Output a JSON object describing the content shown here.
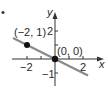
{
  "figure": {
    "bullet": "•",
    "axes": {
      "x_label": "x",
      "y_label": "y",
      "x_ticks": [
        {
          "value": -2,
          "label": "−2"
        },
        {
          "value": 2,
          "label": "2"
        }
      ],
      "y_ticks": [
        {
          "value": 2,
          "label": "2"
        },
        {
          "value": -1,
          "label": "−1"
        }
      ]
    },
    "points": [
      {
        "x": -2,
        "y": 1,
        "label": "(−2, 1)"
      },
      {
        "x": 0,
        "y": 0,
        "label": "(0, 0)"
      }
    ],
    "line": {
      "slope": -0.5,
      "intercept": 0,
      "color": "#8a8a8a"
    },
    "colors": {
      "axis": "#333333",
      "point": "#111111",
      "line": "#8a8a8a"
    }
  }
}
